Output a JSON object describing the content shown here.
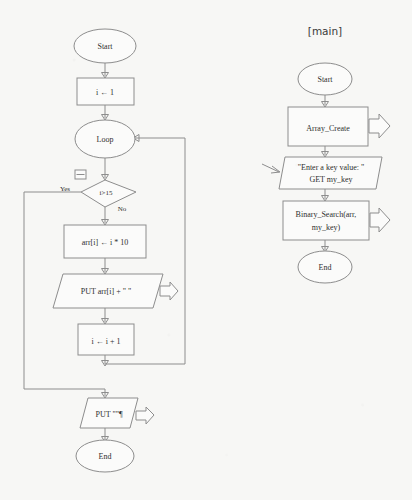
{
  "document": {
    "background_color": "#f7f7f5",
    "line_color": "#8d8d8d",
    "text_color": "#2f2f2f"
  },
  "main_title": "[main]",
  "left_flowchart": {
    "name": "array-create-subroutine",
    "nodes": {
      "start": "Start",
      "init": "i ← 1",
      "loop": "Loop",
      "condition": "i>15",
      "yes_label": "Yes",
      "no_label": "No",
      "assign": "arr[i] ← i * 10",
      "put_element": "PUT arr[i] + \"  \"",
      "increment": "i ← i + 1",
      "put_newline": "PUT \"\"¶",
      "end": "End"
    }
  },
  "right_flowchart": {
    "name": "main-routine",
    "nodes": {
      "start": "Start",
      "array_create": "Array_Create",
      "prompt_line1": "\"Enter a key value: \"",
      "prompt_line2": "GET my_key",
      "binary_search_line1": "Binary_Search(arr,",
      "binary_search_line2": "my_key)",
      "end": "End"
    }
  }
}
